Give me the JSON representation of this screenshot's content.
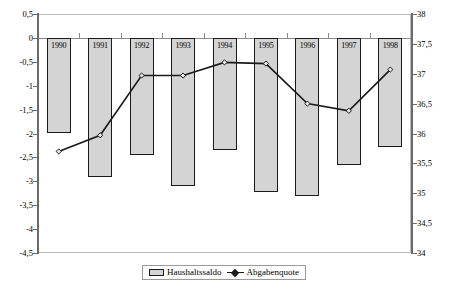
{
  "chart_data": {
    "type": "bar",
    "title": "",
    "subtitle": "",
    "xlabel": "",
    "ylabel": "",
    "grid": false,
    "legend_position": "bottom",
    "categories": [
      "1990",
      "1991",
      "1992",
      "1993",
      "1994",
      "1995",
      "1996",
      "1997",
      "1998"
    ],
    "left_axis": {
      "label": "",
      "ylim": [
        -4.5,
        0.5
      ],
      "tick_step": 0.5,
      "ticks": [
        "0,5",
        "0",
        "-0,5",
        "-1",
        "-1,5",
        "-2",
        "-2,5",
        "-3",
        "-3,5",
        "-4",
        "-4,5"
      ],
      "tick_values": [
        0.5,
        0,
        -0.5,
        -1,
        -1.5,
        -2,
        -2.5,
        -3,
        -3.5,
        -4,
        -4.5
      ]
    },
    "right_axis": {
      "label": "",
      "ylim": [
        34,
        38
      ],
      "tick_step": 0.5,
      "ticks": [
        "38",
        "37,5",
        "37",
        "36,5",
        "36",
        "35,5",
        "35",
        "34,5",
        "34"
      ],
      "tick_values": [
        38,
        37.5,
        37,
        36.5,
        36,
        35.5,
        35,
        34.5,
        34
      ]
    },
    "series": [
      {
        "name": "Haushaltssaldo",
        "type": "bar",
        "axis": "left",
        "values": [
          -2.0,
          -2.9,
          -2.45,
          -3.1,
          -2.35,
          -3.22,
          -3.3,
          -2.66,
          -2.28
        ]
      },
      {
        "name": "Abgabenquote",
        "type": "line",
        "axis": "right",
        "values": [
          35.7,
          35.97,
          36.97,
          36.97,
          37.19,
          37.17,
          36.5,
          36.38,
          37.07
        ]
      }
    ]
  },
  "legend": {
    "items": [
      {
        "label": "Haushaltssaldo",
        "marker": "bar-swatch"
      },
      {
        "label": "Abgabenquote",
        "marker": "line-marker"
      }
    ]
  },
  "colors": {
    "bar_fill": "#d4d4d4",
    "bar_border": "#1a1a1a",
    "line": "#1a1a1a",
    "axis": "#6b6b6b",
    "plot_border": "#b9b9b9",
    "background": "#ffffff"
  }
}
